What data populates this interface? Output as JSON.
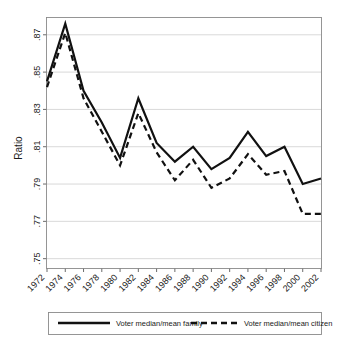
{
  "chart_data": {
    "type": "line",
    "title": "",
    "subtitle": "",
    "xlabel": "",
    "ylabel": "Ratio",
    "grid": "horizontal",
    "legend_position": "bottom",
    "x": [
      1972,
      1974,
      1976,
      1978,
      1980,
      1982,
      1984,
      1986,
      1988,
      1990,
      1992,
      1994,
      1996,
      1998,
      2000,
      2002
    ],
    "xtick_labels": [
      "1972",
      "1974",
      "1976",
      "1978",
      "1980",
      "1982",
      "1984",
      "1986",
      "1988",
      "1990",
      "1992",
      "1994",
      "1996",
      "1998",
      "2000",
      "2002"
    ],
    "ytick_labels": [
      ".87",
      ".85",
      ".83",
      ".81",
      ".79",
      ".77",
      ".75"
    ],
    "ytick_values": [
      0.87,
      0.85,
      0.83,
      0.81,
      0.79,
      0.77,
      0.75
    ],
    "xlim": [
      1972,
      2002
    ],
    "ylim": [
      0.745,
      0.879
    ],
    "series": [
      {
        "name": "Voter median/mean family",
        "style": "solid",
        "color": "#111111",
        "values": [
          0.845,
          0.876,
          0.84,
          0.823,
          0.804,
          0.836,
          0.812,
          0.802,
          0.81,
          0.798,
          0.804,
          0.818,
          0.805,
          0.81,
          0.79,
          0.793
        ]
      },
      {
        "name": "Voter median/mean citizen",
        "style": "dashed",
        "color": "#111111",
        "values": [
          0.842,
          0.871,
          0.836,
          0.818,
          0.8,
          0.828,
          0.807,
          0.792,
          0.803,
          0.788,
          0.793,
          0.806,
          0.795,
          0.797,
          0.774,
          0.774
        ]
      }
    ]
  },
  "legend": {
    "items": [
      {
        "label": "Voter median/mean family",
        "style": "solid"
      },
      {
        "label": "Voter median/mean citizen",
        "style": "dashed"
      }
    ]
  },
  "axes": {
    "y_title": "Ratio"
  }
}
